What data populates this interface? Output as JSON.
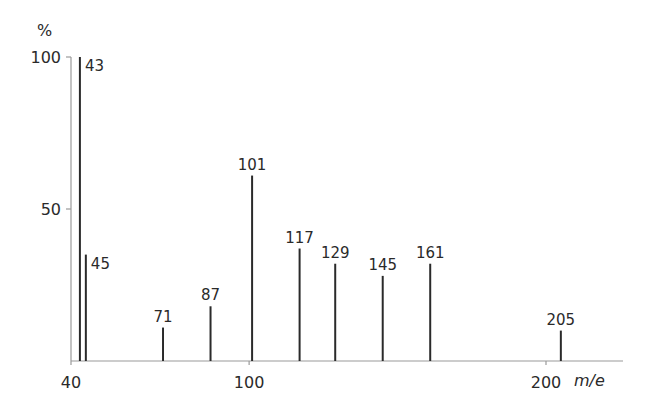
{
  "chart_data": {
    "type": "bar",
    "subtype": "mass-spectrum-stick",
    "title": "",
    "xlabel": "m/e",
    "ylabel": "%",
    "xlim": [
      40,
      225
    ],
    "ylim": [
      0,
      100
    ],
    "x_ticks": [
      40,
      100,
      200
    ],
    "y_ticks": [
      50,
      100
    ],
    "x_tick_labels": [
      "40",
      "100",
      "200"
    ],
    "y_tick_labels": [
      "50",
      "100"
    ],
    "grid": false,
    "legend": null,
    "peaks": [
      {
        "mz": 43,
        "intensity": 100,
        "label": "43"
      },
      {
        "mz": 45,
        "intensity": 35,
        "label": "45"
      },
      {
        "mz": 71,
        "intensity": 11,
        "label": "71"
      },
      {
        "mz": 87,
        "intensity": 18,
        "label": "87"
      },
      {
        "mz": 101,
        "intensity": 61,
        "label": "101"
      },
      {
        "mz": 117,
        "intensity": 37,
        "label": "117"
      },
      {
        "mz": 129,
        "intensity": 32,
        "label": "129"
      },
      {
        "mz": 145,
        "intensity": 28,
        "label": "145"
      },
      {
        "mz": 161,
        "intensity": 32,
        "label": "161"
      },
      {
        "mz": 205,
        "intensity": 10,
        "label": "205"
      }
    ]
  }
}
